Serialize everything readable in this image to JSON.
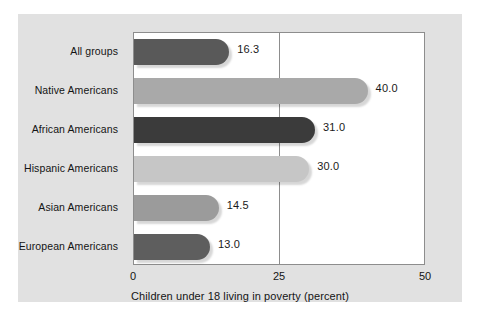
{
  "figure": {
    "panel_color": "#e1e1e1",
    "plot_background": "#ffffff",
    "border_color": "#8d8d8d"
  },
  "chart_data": {
    "type": "bar",
    "orientation": "horizontal",
    "title": "",
    "xlabel": "Children under 18 living in poverty (percent)",
    "ylabel": "",
    "xlim": [
      0,
      50
    ],
    "xticks": [
      "0",
      "25",
      "50"
    ],
    "xtick_values": [
      0,
      25,
      50
    ],
    "grid": "vertical gridline at 25",
    "legend": "none",
    "categories": [
      "All groups",
      "Native Americans",
      "African Americans",
      "Hispanic Americans",
      "Asian Americans",
      "European Americans"
    ],
    "values": [
      16.3,
      40.0,
      31.0,
      30.0,
      14.5,
      13.0
    ],
    "value_labels": [
      "16.3",
      "40.0",
      "31.0",
      "30.0",
      "14.5",
      "13.0"
    ],
    "bar_colors": [
      "#595959",
      "#a9a9a9",
      "#3b3b3b",
      "#c6c6c6",
      "#9b9b9b",
      "#5e5e5e"
    ]
  },
  "axis": {
    "title": "Children under 18 living in poverty (percent)",
    "ticks": [
      {
        "label": "0",
        "value": 0
      },
      {
        "label": "25",
        "value": 25
      },
      {
        "label": "50",
        "value": 50
      }
    ]
  }
}
